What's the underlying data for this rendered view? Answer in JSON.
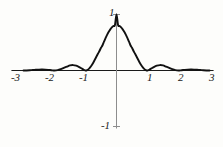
{
  "chart_data": {
    "type": "line",
    "title": "",
    "subtitle": "",
    "xlabel": "",
    "ylabel": "",
    "function": "sinc squared",
    "xlim": [
      -3.2,
      3.2
    ],
    "ylim": [
      -1.25,
      1.15
    ],
    "grid": false,
    "legend": null,
    "x_ticks": [
      -3,
      -2,
      -1,
      1,
      2,
      3
    ],
    "x_tick_labels": [
      "-3",
      "-2",
      "-1",
      "1",
      "2",
      "3"
    ],
    "y_ticks": [
      1,
      -1
    ],
    "y_tick_labels": [
      "1",
      "-1"
    ],
    "series": [
      {
        "name": "sinc squared",
        "color": "#111111",
        "line_width": 1.9,
        "x": [
          -3.0,
          -2.9,
          -2.8,
          -2.7,
          -2.6,
          -2.5,
          -2.4,
          -2.3,
          -2.2,
          -2.1,
          -2.0,
          -1.9,
          -1.8,
          -1.7,
          -1.6,
          -1.5,
          -1.4,
          -1.3,
          -1.2,
          -1.1,
          -1.0,
          -0.95,
          -0.9,
          -0.85,
          -0.8,
          -0.75,
          -0.7,
          -0.65,
          -0.6,
          -0.55,
          -0.5,
          -0.45,
          -0.4,
          -0.35,
          -0.3,
          -0.25,
          -0.2,
          -0.15,
          -0.1,
          -0.05,
          0.0,
          0.05,
          0.1,
          0.15,
          0.2,
          0.25,
          0.3,
          0.35,
          0.4,
          0.45,
          0.5,
          0.55,
          0.6,
          0.65,
          0.7,
          0.75,
          0.8,
          0.85,
          0.9,
          0.95,
          1.0,
          1.1,
          1.2,
          1.3,
          1.4,
          1.5,
          1.6,
          1.7,
          1.8,
          1.9,
          2.0,
          2.1,
          2.2,
          2.3,
          2.4,
          2.5,
          2.6,
          2.7,
          2.8,
          2.9,
          3.0
        ],
        "y": [
          0.0,
          0.0011,
          0.0041,
          0.0082,
          0.0124,
          0.0162,
          0.0173,
          0.0152,
          0.0108,
          0.0053,
          0.0,
          0.0061,
          0.0232,
          0.0463,
          0.0689,
          0.0901,
          0.0968,
          0.0854,
          0.0608,
          0.0299,
          0.0,
          0.0062,
          0.0246,
          0.0543,
          0.0935,
          0.14,
          0.1913,
          0.2448,
          0.298,
          0.3487,
          0.4053,
          0.4516,
          0.5187,
          0.5818,
          0.6394,
          0.6903,
          0.7336,
          0.7684,
          0.7943,
          0.811,
          1.0,
          0.811,
          0.7943,
          0.7684,
          0.7336,
          0.6903,
          0.6394,
          0.5818,
          0.5187,
          0.4516,
          0.4053,
          0.3487,
          0.298,
          0.2448,
          0.1913,
          0.14,
          0.0935,
          0.0543,
          0.0246,
          0.0062,
          0.0,
          0.0299,
          0.0608,
          0.0854,
          0.0968,
          0.0901,
          0.0689,
          0.0463,
          0.0232,
          0.0061,
          0.0,
          0.0053,
          0.0108,
          0.0152,
          0.0173,
          0.0162,
          0.0124,
          0.0082,
          0.0041,
          0.0011,
          0.0
        ]
      }
    ],
    "axes": {
      "x_axis_color": "#1a1a1a",
      "y_axis_color": "#8d8d8d"
    }
  },
  "axis_labels": {
    "x": [
      {
        "id": "xm3",
        "text": "-3"
      },
      {
        "id": "xm2",
        "text": "-2"
      },
      {
        "id": "xm1",
        "text": "-1"
      },
      {
        "id": "xp1",
        "text": "1"
      },
      {
        "id": "xp2",
        "text": "2"
      },
      {
        "id": "xp3",
        "text": "3"
      }
    ],
    "y": [
      {
        "id": "yp1",
        "text": "1"
      },
      {
        "id": "ym1",
        "text": "-1"
      }
    ]
  }
}
